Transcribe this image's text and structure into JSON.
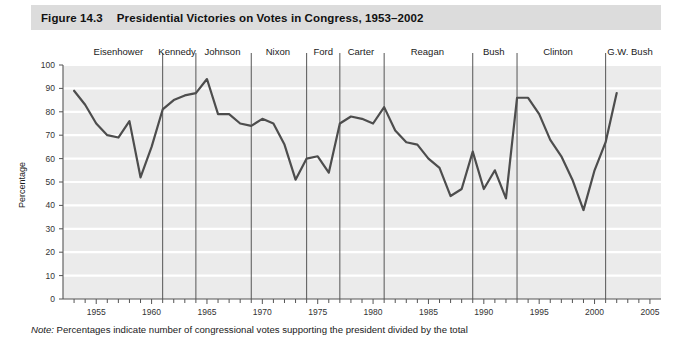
{
  "header": {
    "figure_number": "Figure 14.3",
    "title": "Presidential Victories on Votes in Congress, 1953–2002"
  },
  "note": {
    "label": "Note:",
    "text": " Percentages indicate number of congressional votes supporting the president divided by the total"
  },
  "colors": {
    "header_bg": "#dcdcdc",
    "plot_bg": "#ebebeb",
    "gridline": "#ffffff",
    "line": "#4d4d4d",
    "divider": "#555555",
    "axis": "#555555",
    "text": "#1a1a1a"
  },
  "chart_data": {
    "type": "line",
    "title": "Presidential Victories on Votes in Congress, 1953–2002",
    "xlabel": "",
    "ylabel": "Percentage",
    "xlim": [
      1952,
      2006
    ],
    "ylim": [
      0,
      100
    ],
    "ytick_step": 10,
    "grid": true,
    "legend_position": "none",
    "yticks": [
      0,
      10,
      20,
      30,
      40,
      50,
      60,
      70,
      80,
      90,
      100
    ],
    "xticks_labeled": [
      1955,
      1960,
      1965,
      1970,
      1975,
      1980,
      1985,
      1990,
      1995,
      2000,
      2005
    ],
    "xticks_minor_start": 1953,
    "xticks_minor_end": 2005,
    "x": [
      1953,
      1954,
      1955,
      1956,
      1957,
      1958,
      1959,
      1960,
      1961,
      1962,
      1963,
      1964,
      1965,
      1966,
      1967,
      1968,
      1969,
      1970,
      1971,
      1972,
      1973,
      1974,
      1975,
      1976,
      1977,
      1978,
      1979,
      1980,
      1981,
      1982,
      1983,
      1984,
      1985,
      1986,
      1987,
      1988,
      1989,
      1990,
      1991,
      1992,
      1993,
      1994,
      1995,
      1996,
      1997,
      1998,
      1999,
      2000,
      2001,
      2002
    ],
    "series": [
      {
        "name": "Presidential victories on votes in Congress",
        "values": [
          89,
          83,
          75,
          70,
          69,
          76,
          52,
          65,
          81,
          85,
          87,
          88,
          94,
          79,
          79,
          75,
          74,
          77,
          75,
          66,
          51,
          60,
          61,
          54,
          75,
          78,
          77,
          75,
          82,
          72,
          67,
          66,
          60,
          56,
          44,
          47,
          63,
          47,
          55,
          43,
          86,
          86,
          79,
          68,
          61,
          51,
          38,
          55,
          67,
          88
        ]
      }
    ],
    "presidents": [
      {
        "name": "Eisenhower",
        "start": 1953,
        "end": 1961,
        "label_x": 1957
      },
      {
        "name": "Kennedy",
        "start": 1961,
        "end": 1964,
        "label_x": 1962.3
      },
      {
        "name": "Johnson",
        "start": 1964,
        "end": 1969,
        "label_x": 1966.4
      },
      {
        "name": "Nixon",
        "start": 1969,
        "end": 1974,
        "label_x": 1971.4
      },
      {
        "name": "Ford",
        "start": 1974,
        "end": 1977,
        "label_x": 1975.5
      },
      {
        "name": "Carter",
        "start": 1977,
        "end": 1981,
        "label_x": 1978.9
      },
      {
        "name": "Reagan",
        "start": 1981,
        "end": 1989,
        "label_x": 1984.9
      },
      {
        "name": "Bush",
        "start": 1989,
        "end": 1993,
        "label_x": 1990.9
      },
      {
        "name": "Clinton",
        "start": 1993,
        "end": 2001,
        "label_x": 1996.7
      },
      {
        "name": "G.W. Bush",
        "start": 2001,
        "end": 2006,
        "label_x": 2003.2
      }
    ],
    "divider_years": [
      1961,
      1964,
      1969,
      1974,
      1977,
      1981,
      1989,
      1993,
      2001
    ]
  }
}
